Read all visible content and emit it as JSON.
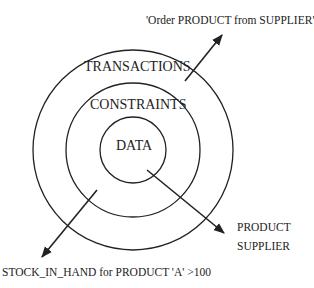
{
  "diagram": {
    "type": "concentric-layers",
    "colors": {
      "stroke": "#222222",
      "text": "#222222",
      "background": "#ffffff"
    },
    "rings": [
      {
        "id": "outer",
        "label": "TRANSACTIONS"
      },
      {
        "id": "middle",
        "label": "CONSTRAINTS"
      },
      {
        "id": "inner",
        "label": "DATA"
      }
    ],
    "annotations": {
      "transaction_example": "'Order PRODUCT from SUPPLIER'",
      "data_example_line1": "PRODUCT",
      "data_example_line2": "SUPPLIER",
      "constraint_example": "STOCK_IN_HAND for PRODUCT 'A' >100"
    },
    "arrows": [
      {
        "from": "TRANSACTIONS",
        "to": "'Order PRODUCT from SUPPLIER'"
      },
      {
        "from": "DATA",
        "to": "PRODUCT / SUPPLIER"
      },
      {
        "from": "CONSTRAINTS",
        "to": "STOCK_IN_HAND for PRODUCT 'A' >100"
      }
    ]
  }
}
